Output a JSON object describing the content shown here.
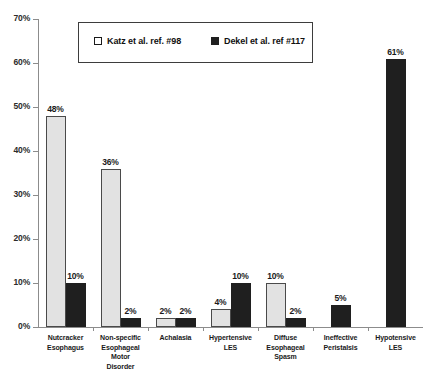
{
  "chart_data": {
    "type": "bar",
    "title": "",
    "xlabel": "",
    "ylabel": "",
    "ylim": [
      0,
      70
    ],
    "ytick_labels": [
      "0%",
      "10%",
      "20%",
      "30%",
      "40%",
      "50%",
      "60%",
      "70%"
    ],
    "ytick_values": [
      0,
      10,
      20,
      30,
      40,
      50,
      60,
      70
    ],
    "grid": false,
    "legend_position": "top-center",
    "categories": [
      "Nutcracker Esophagus",
      "Non-specific Esophageal Motor Disorder",
      "Achalasia",
      "Hypertensive LES",
      "Diffuse Esophageal Spasm",
      "Ineffective Peristalsis",
      "Hypotensive LES"
    ],
    "category_lines": [
      [
        "Nutcracker",
        "Esophagus"
      ],
      [
        "Non-specific",
        "Esophageal",
        "Motor",
        "Disorder"
      ],
      [
        "Achalasia"
      ],
      [
        "Hypertensive",
        "LES"
      ],
      [
        "Diffuse",
        "Esophageal",
        "Spasm"
      ],
      [
        "Ineffective",
        "Peristalsis"
      ],
      [
        "Hypotensive",
        "LES"
      ]
    ],
    "series": [
      {
        "name": "Katz et al. ref. #98",
        "color": "#e2e2e2",
        "values": [
          48,
          36,
          2,
          4,
          10,
          null,
          null
        ],
        "labels": [
          "48%",
          "36%",
          "2%",
          "4%",
          "10%",
          "",
          ""
        ]
      },
      {
        "name": "Dekel et al. ref #117",
        "color": "#1f1f1f",
        "values": [
          10,
          2,
          2,
          10,
          2,
          5,
          61
        ],
        "labels": [
          "10%",
          "2%",
          "2%",
          "10%",
          "2%",
          "5%",
          "61%"
        ]
      }
    ]
  },
  "legend": {
    "items": [
      {
        "label": "Katz et al. ref. #98",
        "swatch": "open-square-icon"
      },
      {
        "label": "Dekel et al. ref #117",
        "swatch": "filled-square-icon"
      }
    ]
  }
}
